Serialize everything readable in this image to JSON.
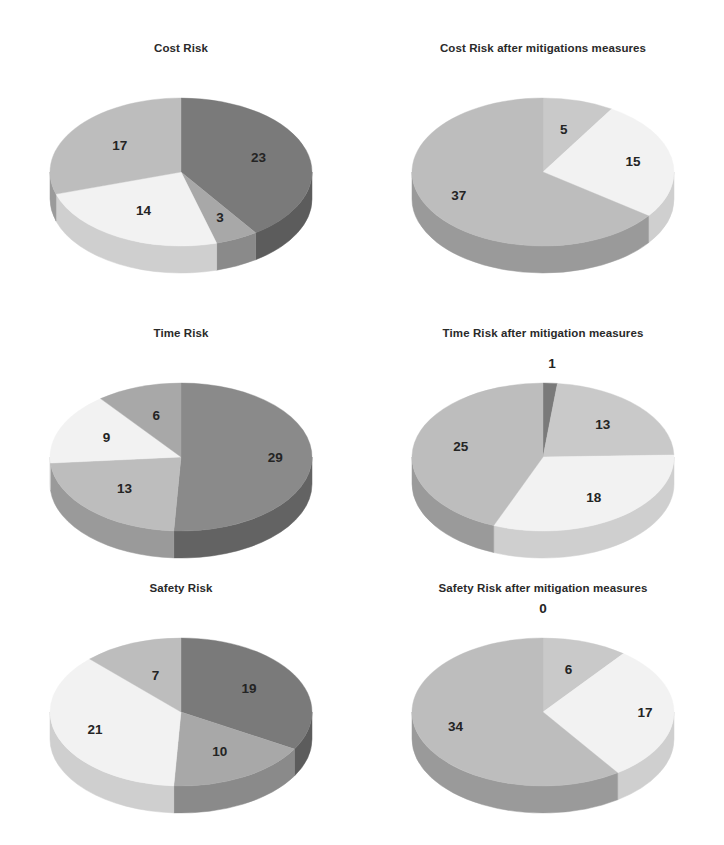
{
  "page": {
    "background": "#ffffff",
    "layout": "2 columns x 3 rows of 3D pie charts",
    "label_color": "#242424",
    "title_color": "#2a2a2a"
  },
  "palette": {
    "dark_gray": "#7a7a7a",
    "mid_gray": "#a8a8a8",
    "light_gray": "#c9c9c9",
    "near_white": "#f2f2f2",
    "rim_dark_gray": "#5c5c5c",
    "rim_mid_gray": "#8a8a8a",
    "rim_light_gray": "#a6a6a6",
    "rim_near_white": "#cfcfcf"
  },
  "charts": [
    {
      "id": "cost-risk",
      "title": "Cost Risk",
      "row": 0,
      "col": 0,
      "start_angle": 0,
      "total": 57,
      "slices": [
        {
          "value": 23,
          "label": "23",
          "color": "#7a7a7a",
          "rim": "#5c5c5c",
          "label_r": 0.62
        },
        {
          "value": 3,
          "label": "3",
          "color": "#a8a8a8",
          "rim": "#8a8a8a",
          "label_r": 0.7
        },
        {
          "value": 14,
          "label": "14",
          "color": "#f2f2f2",
          "rim": "#cfcfcf",
          "label_r": 0.6
        },
        {
          "value": 17,
          "label": "17",
          "color": "#bdbdbd",
          "rim": "#9a9a9a",
          "label_r": 0.58
        }
      ]
    },
    {
      "id": "cost-risk-after",
      "title": "Cost Risk after mitigations measures",
      "row": 0,
      "col": 1,
      "start_angle": 0,
      "total": 57,
      "slices": [
        {
          "value": 5,
          "label": "5",
          "color": "#c9c9c9",
          "rim": "#a6a6a6",
          "label_r": 0.58
        },
        {
          "value": 15,
          "label": "15",
          "color": "#f2f2f2",
          "rim": "#cfcfcf",
          "label_r": 0.7
        },
        {
          "value": 37,
          "label": "37",
          "color": "#bdbdbd",
          "rim": "#9a9a9a",
          "label_r": 0.72
        }
      ]
    },
    {
      "id": "time-risk",
      "title": "Time Risk",
      "row": 1,
      "col": 0,
      "start_angle": 0,
      "total": 57,
      "slices": [
        {
          "value": 29,
          "label": "29",
          "color": "#8a8a8a",
          "rim": "#636363",
          "label_r": 0.72
        },
        {
          "value": 13,
          "label": "13",
          "color": "#bdbdbd",
          "rim": "#9a9a9a",
          "label_r": 0.62
        },
        {
          "value": 9,
          "label": "9",
          "color": "#f2f2f2",
          "rim": "#cfcfcf",
          "label_r": 0.62
        },
        {
          "value": 6,
          "label": "6",
          "color": "#a8a8a8",
          "rim": "#8a8a8a",
          "label_r": 0.58
        }
      ]
    },
    {
      "id": "time-risk-after",
      "title": "Time Risk after mitigation measures",
      "row": 1,
      "col": 1,
      "start_angle": 0,
      "total": 57,
      "slices": [
        {
          "value": 1,
          "label": "1",
          "color": "#7a7a7a",
          "rim": "#5c5c5c",
          "label_r": 1.25
        },
        {
          "value": 13,
          "label": "13",
          "color": "#c9c9c9",
          "rim": "#a6a6a6",
          "label_r": 0.62
        },
        {
          "value": 18,
          "label": "18",
          "color": "#f2f2f2",
          "rim": "#cfcfcf",
          "label_r": 0.68
        },
        {
          "value": 25,
          "label": "25",
          "color": "#bdbdbd",
          "rim": "#9a9a9a",
          "label_r": 0.64
        }
      ]
    },
    {
      "id": "safety-risk",
      "title": "Safety Risk",
      "row": 2,
      "col": 0,
      "start_angle": 0,
      "total": 57,
      "slices": [
        {
          "value": 19,
          "label": "19",
          "color": "#7a7a7a",
          "rim": "#5c5c5c",
          "label_r": 0.6
        },
        {
          "value": 10,
          "label": "10",
          "color": "#a8a8a8",
          "rim": "#8a8a8a",
          "label_r": 0.62
        },
        {
          "value": 21,
          "label": "21",
          "color": "#f2f2f2",
          "rim": "#cfcfcf",
          "label_r": 0.7
        },
        {
          "value": 7,
          "label": "7",
          "color": "#bdbdbd",
          "rim": "#9a9a9a",
          "label_r": 0.52
        }
      ]
    },
    {
      "id": "safety-risk-after",
      "title": "Safety Risk after mitigation measures",
      "row": 2,
      "col": 1,
      "start_angle": 0,
      "total": 57,
      "slices": [
        {
          "value": 0,
          "label": "0",
          "color": "#9a9a9a",
          "rim": "#7a7a7a",
          "label_r": 1.38
        },
        {
          "value": 6,
          "label": "6",
          "color": "#c9c9c9",
          "rim": "#a6a6a6",
          "label_r": 0.6
        },
        {
          "value": 17,
          "label": "17",
          "color": "#f2f2f2",
          "rim": "#cfcfcf",
          "label_r": 0.78
        },
        {
          "value": 34,
          "label": "34",
          "color": "#bdbdbd",
          "rim": "#9a9a9a",
          "label_r": 0.7
        }
      ]
    }
  ],
  "chart_data": [
    {
      "type": "pie",
      "title": "Cost Risk",
      "categories": [
        "23",
        "3",
        "14",
        "17"
      ],
      "values": [
        23,
        3,
        14,
        17
      ],
      "total": 57,
      "legend": "none",
      "annotations": [
        "23",
        "3",
        "14",
        "17"
      ],
      "xlabel": "",
      "ylabel": ""
    },
    {
      "type": "pie",
      "title": "Cost Risk after mitigations measures",
      "categories": [
        "5",
        "15",
        "37"
      ],
      "values": [
        5,
        15,
        37
      ],
      "total": 57,
      "legend": "none",
      "annotations": [
        "5",
        "15",
        "37"
      ],
      "xlabel": "",
      "ylabel": ""
    },
    {
      "type": "pie",
      "title": "Time Risk",
      "categories": [
        "29",
        "13",
        "9",
        "6"
      ],
      "values": [
        29,
        13,
        9,
        6
      ],
      "total": 57,
      "legend": "none",
      "annotations": [
        "29",
        "13",
        "9",
        "6"
      ],
      "xlabel": "",
      "ylabel": ""
    },
    {
      "type": "pie",
      "title": "Time Risk after mitigation measures",
      "categories": [
        "1",
        "13",
        "18",
        "25"
      ],
      "values": [
        1,
        13,
        18,
        25
      ],
      "total": 57,
      "legend": "none",
      "annotations": [
        "1",
        "13",
        "18",
        "25"
      ],
      "xlabel": "",
      "ylabel": ""
    },
    {
      "type": "pie",
      "title": "Safety Risk",
      "categories": [
        "19",
        "10",
        "21",
        "7"
      ],
      "values": [
        19,
        10,
        21,
        7
      ],
      "total": 57,
      "legend": "none",
      "annotations": [
        "19",
        "10",
        "21",
        "7"
      ],
      "xlabel": "",
      "ylabel": ""
    },
    {
      "type": "pie",
      "title": "Safety Risk after mitigation measures",
      "categories": [
        "0",
        "6",
        "17",
        "34"
      ],
      "values": [
        0,
        6,
        17,
        34
      ],
      "total": 57,
      "legend": "none",
      "annotations": [
        "0",
        "6",
        "17",
        "34"
      ],
      "xlabel": "",
      "ylabel": ""
    }
  ]
}
